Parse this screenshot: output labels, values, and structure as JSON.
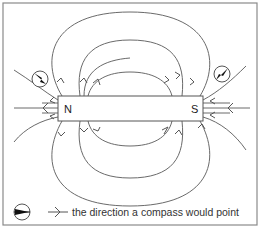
{
  "diagram": {
    "magnet": {
      "north_label": "N",
      "south_label": "S"
    },
    "compasses": [
      {
        "position": "upper-left of N pole",
        "needle_direction": "points down-right toward N pole region (along field)"
      },
      {
        "position": "upper-right of S pole",
        "needle_direction": "points down-left toward S pole"
      }
    ],
    "field_direction": "Field lines leave N pole and enter S pole",
    "legend": {
      "compass_symbol": "compass-icon",
      "arrow_symbol": "arrow-icon",
      "text": "the direction a compass would point"
    },
    "colors": {
      "line": "#6a6a6a",
      "frame": "#8a8a8a",
      "background": "#ffffff"
    }
  }
}
